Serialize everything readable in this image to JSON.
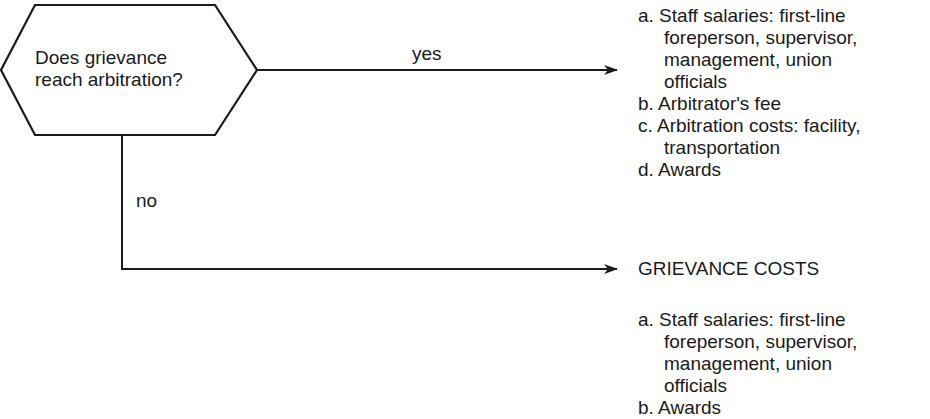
{
  "decision": {
    "line1": "Does grievance",
    "line2": "reach arbitration?"
  },
  "branches": {
    "yes_label": "yes",
    "no_label": "no"
  },
  "arbitration_costs": {
    "items": [
      {
        "lines": [
          "a. Staff salaries: first-line",
          "foreperson, supervisor,",
          "management, union",
          "officials"
        ]
      },
      {
        "lines": [
          "b. Arbitrator's fee"
        ]
      },
      {
        "lines": [
          "c. Arbitration costs: facility,",
          "transportation"
        ]
      },
      {
        "lines": [
          "d. Awards"
        ]
      }
    ]
  },
  "grievance_costs": {
    "heading": "GRIEVANCE COSTS",
    "items": [
      {
        "lines": [
          "a. Staff salaries: first-line",
          "foreperson, supervisor,",
          "management, union",
          "officials"
        ]
      },
      {
        "lines": [
          "b. Awards"
        ]
      }
    ]
  },
  "colors": {
    "stroke": "#1a1a1a",
    "background": "#ffffff"
  }
}
